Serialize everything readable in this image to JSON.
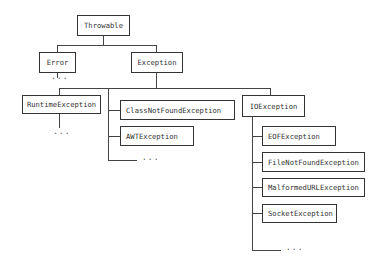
{
  "diagram": {
    "type": "class-hierarchy-tree",
    "nodes": {
      "throwable": "Throwable",
      "error": "Error",
      "exception": "Exception",
      "runtime_exception": "RuntimeException",
      "class_not_found_exception": "ClassNotFoundException",
      "awt_exception": "AWTException",
      "io_exception": "IOException",
      "eof_exception": "EOFException",
      "file_not_found_exception": "FileNotFoundException",
      "malformed_url_exception": "MalformedURLException",
      "socket_exception": "SocketException"
    },
    "ellipsis": "...",
    "edges": [
      [
        "Throwable",
        "Error"
      ],
      [
        "Throwable",
        "Exception"
      ],
      [
        "Exception",
        "RuntimeException"
      ],
      [
        "Exception",
        "ClassNotFoundException"
      ],
      [
        "Exception",
        "AWTException"
      ],
      [
        "Exception",
        "IOException"
      ],
      [
        "IOException",
        "EOFException"
      ],
      [
        "IOException",
        "FileNotFoundException"
      ],
      [
        "IOException",
        "MalformedURLException"
      ],
      [
        "IOException",
        "SocketException"
      ]
    ]
  }
}
